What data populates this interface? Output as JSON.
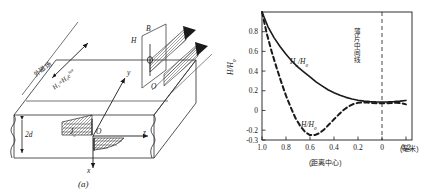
{
  "figure": {
    "panel_a_caption": "(a)",
    "panel_b_caption": "(b)"
  },
  "panel_a": {
    "name": "slab-geometry-diagram",
    "external_field_text": "外磁场",
    "field_equation": "H₁=H₀e",
    "field_equation_exp": "iωt",
    "thickness_label": "2d",
    "current_label": "J",
    "current_sub": "s",
    "axis_x": "x",
    "axis_y": "y",
    "axis_z": "z",
    "origin": "O",
    "inset_origin": "O",
    "inset_h": "H",
    "inset_b": "B"
  },
  "chart_data": {
    "type": "line",
    "title": "",
    "xlabel": "(距离中心)",
    "xunit": "(毫米)",
    "ylabel": "H/H₀",
    "ylabel_main": "H/H",
    "ylabel_sub": "0",
    "xlim": [
      1.0,
      -0.25
    ],
    "ylim": [
      -0.3,
      1.0
    ],
    "xticks": [
      "1.0",
      "0.8",
      "0.6",
      "0.4",
      "0.2",
      "0",
      "0.2"
    ],
    "xtick_values": [
      1.0,
      0.8,
      0.6,
      0.4,
      0.2,
      0.0,
      -0.2
    ],
    "yticks": [
      "0.8",
      "0.6",
      "0.4",
      "0.2",
      "0",
      "-0.2",
      "-0.3"
    ],
    "ytick_values": [
      0.8,
      0.6,
      0.4,
      0.2,
      0.0,
      -0.2,
      -0.3
    ],
    "grid": false,
    "legend": "inline-annotations",
    "annotations": [
      {
        "name": "center-line-label",
        "text": "薄片中间线",
        "x": 0.0,
        "orientation": "vertical"
      },
      {
        "name": "solid-curve-label",
        "text": "Ha/H0",
        "x": 0.45,
        "y": 0.33
      },
      {
        "name": "dashed-curve-label",
        "text": "H/H0",
        "x": 0.33,
        "y": -0.18
      }
    ],
    "curve_label_solid_main": "H",
    "curve_label_solid_sub1": "a",
    "curve_label_solid_mid": "/H",
    "curve_label_solid_sub2": "0",
    "curve_label_dashed_main": "H/H",
    "curve_label_dashed_sub": "0",
    "center_line": {
      "x": 0.0,
      "style": "dashed",
      "name": "plate-center-line"
    },
    "series": [
      {
        "name": "Ha/H0",
        "style": "solid",
        "x": [
          1.0,
          0.95,
          0.9,
          0.85,
          0.8,
          0.75,
          0.7,
          0.65,
          0.6,
          0.55,
          0.5,
          0.45,
          0.4,
          0.35,
          0.3,
          0.25,
          0.2,
          0.15,
          0.1,
          0.05,
          0.0,
          -0.05,
          -0.1,
          -0.15,
          -0.2
        ],
        "values": [
          1.0,
          0.85,
          0.74,
          0.65,
          0.57,
          0.5,
          0.44,
          0.39,
          0.34,
          0.29,
          0.25,
          0.21,
          0.18,
          0.155,
          0.133,
          0.117,
          0.104,
          0.095,
          0.09,
          0.087,
          0.086,
          0.087,
          0.09,
          0.095,
          0.102
        ]
      },
      {
        "name": "H/H0",
        "style": "dashed",
        "x": [
          1.0,
          0.96,
          0.92,
          0.88,
          0.84,
          0.8,
          0.76,
          0.72,
          0.68,
          0.64,
          0.6,
          0.56,
          0.52,
          0.48,
          0.44,
          0.4,
          0.36,
          0.32,
          0.28,
          0.24,
          0.2,
          0.16,
          0.12,
          0.08,
          0.04,
          0.0,
          -0.04,
          -0.08,
          -0.12,
          -0.16,
          -0.2
        ],
        "values": [
          1.0,
          0.78,
          0.6,
          0.44,
          0.29,
          0.15,
          0.03,
          -0.08,
          -0.16,
          -0.22,
          -0.25,
          -0.25,
          -0.23,
          -0.19,
          -0.14,
          -0.09,
          -0.04,
          0.005,
          0.04,
          0.065,
          0.078,
          0.082,
          0.08,
          0.076,
          0.073,
          0.072,
          0.073,
          0.076,
          0.078,
          0.074,
          0.062
        ]
      }
    ]
  }
}
